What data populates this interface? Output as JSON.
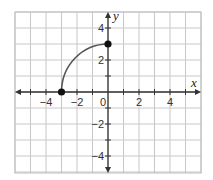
{
  "chart_data": {
    "type": "line",
    "title": "",
    "xlabel": "x",
    "ylabel": "y",
    "xlim": [
      -6,
      6
    ],
    "ylim": [
      -5,
      5
    ],
    "grid": true,
    "x_ticks": [
      -4,
      -2,
      0,
      2,
      4
    ],
    "y_ticks": [
      4,
      2,
      -2,
      -4
    ],
    "x_tick_labels": [
      "−4",
      "−2",
      "0",
      "2",
      "4"
    ],
    "y_tick_labels": [
      "4",
      "2",
      "−2",
      "−4"
    ],
    "series": [
      {
        "name": "curve",
        "description": "Quarter-circle arc from (-3, 0) to (0, 3), concave down",
        "points": [
          [
            -3,
            0
          ],
          [
            -2.8,
            1.0
          ],
          [
            -2.4,
            1.8
          ],
          [
            -1.8,
            2.4
          ],
          [
            -1.0,
            2.8
          ],
          [
            0,
            3
          ]
        ],
        "endpoints": [
          {
            "x": -3,
            "y": 0,
            "closed": true
          },
          {
            "x": 0,
            "y": 3,
            "closed": true
          }
        ]
      }
    ],
    "colors": {
      "grid": "#c8c8c8",
      "axis": "#333333",
      "curve": "#555555",
      "point": "#111111",
      "frame": "#bdbdbd"
    }
  }
}
